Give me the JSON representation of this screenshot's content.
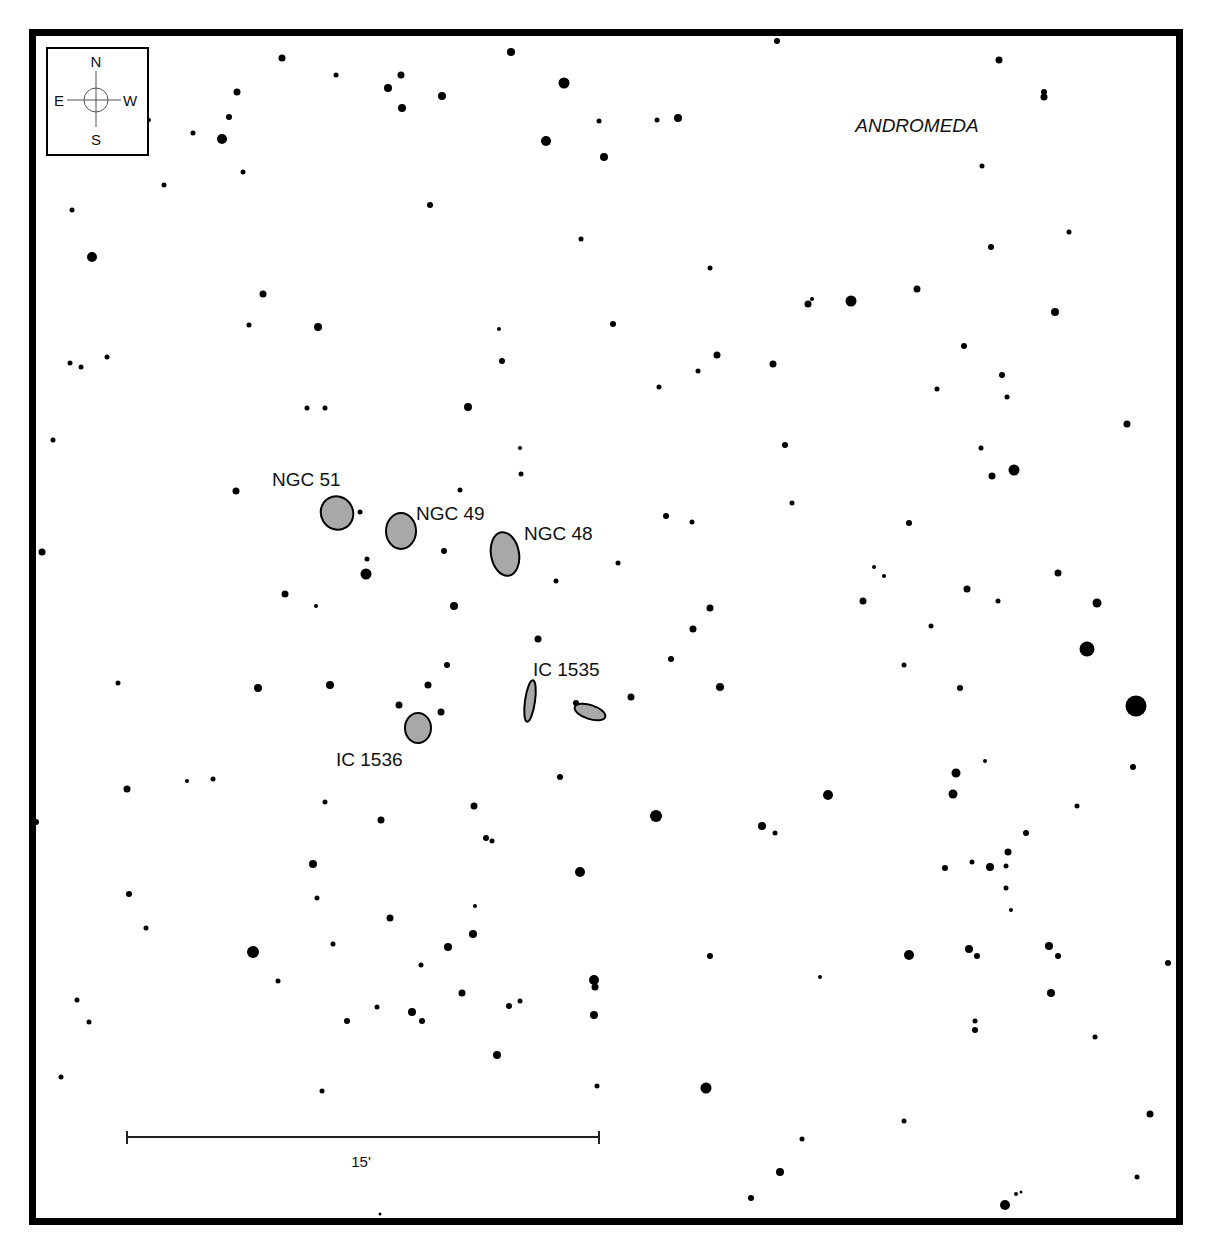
{
  "map": {
    "constellation": "ANDROMEDA",
    "compass": {
      "north": "N",
      "south": "S",
      "east": "E",
      "west": "W"
    },
    "scale_bar": {
      "label": "15'",
      "x1": 127,
      "x2": 599,
      "y": 1137
    },
    "colors": {
      "border": "#000000",
      "star": "#000000",
      "galaxy_fill": "#a8a8a8",
      "galaxy_stroke": "#000000",
      "background": "#ffffff"
    },
    "frame": {
      "x": 29,
      "y": 29,
      "width": 1154,
      "height": 1196,
      "stroke_width": 7
    },
    "galaxies": [
      {
        "name": "NGC 51",
        "cx": 337,
        "cy": 513,
        "rx": 16,
        "ry": 17,
        "rotate": -30,
        "label_x": 272,
        "label_y": 486
      },
      {
        "name": "NGC 49",
        "cx": 401,
        "cy": 531,
        "rx": 15,
        "ry": 18,
        "rotate": 0,
        "label_x": 416,
        "label_y": 520
      },
      {
        "name": "NGC 48",
        "cx": 505,
        "cy": 554,
        "rx": 14,
        "ry": 22,
        "rotate": -10,
        "label_x": 524,
        "label_y": 540
      },
      {
        "name": "IC 1535",
        "cx": 530,
        "cy": 701,
        "rx": 5,
        "ry": 21,
        "rotate": 8,
        "label_x": 533,
        "label_y": 676
      },
      {
        "name": "IC 1535b",
        "cx": 590,
        "cy": 712,
        "rx": 16,
        "ry": 7,
        "rotate": 18,
        "label_x": null,
        "label_y": null
      },
      {
        "name": "IC 1536",
        "cx": 418,
        "cy": 728,
        "rx": 13,
        "ry": 15,
        "rotate": 0,
        "label_x": 336,
        "label_y": 766
      }
    ],
    "stars": [
      [
        511,
        52,
        4
      ],
      [
        777,
        41,
        3
      ],
      [
        999,
        60,
        3.5
      ],
      [
        282,
        58,
        3.5
      ],
      [
        336,
        75,
        2.5
      ],
      [
        401,
        75,
        3.5
      ],
      [
        388,
        88,
        4
      ],
      [
        442,
        96,
        4
      ],
      [
        564,
        83,
        5.5
      ],
      [
        237,
        92,
        3.5
      ],
      [
        1044,
        92,
        3
      ],
      [
        1044,
        97,
        3.5
      ],
      [
        402,
        108,
        4
      ],
      [
        229,
        117,
        3
      ],
      [
        149,
        120,
        2
      ],
      [
        678,
        118,
        4
      ],
      [
        657,
        120,
        2.5
      ],
      [
        599,
        121,
        2.5
      ],
      [
        193,
        133,
        2.5
      ],
      [
        222,
        139,
        5
      ],
      [
        546,
        141,
        5
      ],
      [
        604,
        157,
        4
      ],
      [
        243,
        172,
        2.5
      ],
      [
        164,
        185,
        2.5
      ],
      [
        982,
        166,
        2.5
      ],
      [
        430,
        205,
        3
      ],
      [
        72,
        210,
        2.5
      ],
      [
        581,
        239,
        2.5
      ],
      [
        1069,
        232,
        2.5
      ],
      [
        991,
        247,
        3
      ],
      [
        92,
        257,
        5
      ],
      [
        710,
        268,
        2.5
      ],
      [
        263,
        294,
        3.5
      ],
      [
        917,
        289,
        3.5
      ],
      [
        851,
        301,
        5.5
      ],
      [
        808,
        304,
        3.5
      ],
      [
        812,
        299,
        2
      ],
      [
        1055,
        312,
        4
      ],
      [
        249,
        325,
        2.5
      ],
      [
        318,
        327,
        4
      ],
      [
        613,
        324,
        3
      ],
      [
        499,
        329,
        2
      ],
      [
        964,
        346,
        3
      ],
      [
        717,
        355,
        3.5
      ],
      [
        70,
        363,
        2.5
      ],
      [
        81,
        367,
        2.5
      ],
      [
        107,
        357,
        2.5
      ],
      [
        502,
        361,
        3
      ],
      [
        773,
        364,
        3.5
      ],
      [
        698,
        371,
        2.5
      ],
      [
        1002,
        375,
        3
      ],
      [
        659,
        387,
        2.5
      ],
      [
        937,
        389,
        2.5
      ],
      [
        1007,
        397,
        2.5
      ],
      [
        307,
        408,
        2.5
      ],
      [
        325,
        408,
        2.5
      ],
      [
        468,
        407,
        4
      ],
      [
        1127,
        424,
        3.5
      ],
      [
        53,
        440,
        2.5
      ],
      [
        785,
        445,
        3
      ],
      [
        520,
        448,
        2
      ],
      [
        981,
        448,
        2.5
      ],
      [
        1014,
        470,
        5.5
      ],
      [
        992,
        476,
        3.5
      ],
      [
        521,
        474,
        2.5
      ],
      [
        460,
        490,
        2.5
      ],
      [
        236,
        491,
        3.5
      ],
      [
        792,
        503,
        2.5
      ],
      [
        360,
        512,
        2.5
      ],
      [
        666,
        516,
        3
      ],
      [
        692,
        522,
        2.5
      ],
      [
        909,
        523,
        3
      ],
      [
        42,
        552,
        3.5
      ],
      [
        444,
        551,
        3
      ],
      [
        367,
        559,
        2.5
      ],
      [
        366,
        574,
        5.5
      ],
      [
        618,
        563,
        2.5
      ],
      [
        874,
        567,
        2
      ],
      [
        884,
        576,
        2
      ],
      [
        1058,
        573,
        3.5
      ],
      [
        556,
        581,
        2.5
      ],
      [
        967,
        589,
        3.5
      ],
      [
        285,
        594,
        3.5
      ],
      [
        863,
        601,
        3.5
      ],
      [
        998,
        601,
        2.5
      ],
      [
        1097,
        603,
        4.5
      ],
      [
        454,
        606,
        4
      ],
      [
        316,
        606,
        2
      ],
      [
        710,
        608,
        3.5
      ],
      [
        931,
        626,
        2.5
      ],
      [
        693,
        629,
        3.5
      ],
      [
        538,
        639,
        3.5
      ],
      [
        1087,
        649,
        7.5
      ],
      [
        447,
        665,
        3
      ],
      [
        904,
        665,
        2.5
      ],
      [
        671,
        659,
        3
      ],
      [
        118,
        683,
        2.5
      ],
      [
        258,
        688,
        4
      ],
      [
        330,
        685,
        4
      ],
      [
        428,
        685,
        3.5
      ],
      [
        720,
        687,
        4
      ],
      [
        960,
        688,
        3
      ],
      [
        631,
        697,
        3.5
      ],
      [
        399,
        705,
        3.5
      ],
      [
        441,
        712,
        3.5
      ],
      [
        576,
        703,
        3
      ],
      [
        1136,
        706,
        10.5
      ],
      [
        1133,
        767,
        3
      ],
      [
        985,
        761,
        2
      ],
      [
        956,
        773,
        4.5
      ],
      [
        560,
        777,
        3
      ],
      [
        187,
        781,
        2
      ],
      [
        213,
        779,
        2.5
      ],
      [
        127,
        789,
        3.5
      ],
      [
        828,
        795,
        5
      ],
      [
        953,
        794,
        4.5
      ],
      [
        325,
        802,
        2.5
      ],
      [
        474,
        806,
        3.5
      ],
      [
        1077,
        806,
        2.5
      ],
      [
        656,
        816,
        6
      ],
      [
        36,
        822,
        3
      ],
      [
        381,
        820,
        3.5
      ],
      [
        762,
        826,
        4
      ],
      [
        775,
        833,
        2.5
      ],
      [
        1026,
        833,
        3
      ],
      [
        486,
        838,
        3
      ],
      [
        492,
        841,
        2.5
      ],
      [
        1008,
        852,
        3.5
      ],
      [
        313,
        864,
        4
      ],
      [
        972,
        862,
        2.5
      ],
      [
        990,
        867,
        4
      ],
      [
        945,
        868,
        3
      ],
      [
        1006,
        866,
        2.5
      ],
      [
        580,
        872,
        5
      ],
      [
        1006,
        888,
        2.5
      ],
      [
        129,
        894,
        3
      ],
      [
        317,
        898,
        2.5
      ],
      [
        1011,
        910,
        2
      ],
      [
        475,
        906,
        2
      ],
      [
        390,
        918,
        3.5
      ],
      [
        146,
        928,
        2.5
      ],
      [
        473,
        934,
        4
      ],
      [
        333,
        944,
        2.5
      ],
      [
        448,
        947,
        4
      ],
      [
        1049,
        946,
        4
      ],
      [
        969,
        949,
        4
      ],
      [
        253,
        952,
        6
      ],
      [
        909,
        955,
        5
      ],
      [
        1058,
        956,
        3
      ],
      [
        977,
        956,
        3
      ],
      [
        710,
        956,
        3
      ],
      [
        1168,
        963,
        3
      ],
      [
        421,
        965,
        2.5
      ],
      [
        820,
        977,
        2
      ],
      [
        278,
        981,
        2.5
      ],
      [
        594,
        980,
        5
      ],
      [
        595,
        987,
        3.5
      ],
      [
        462,
        993,
        3.5
      ],
      [
        1051,
        993,
        4
      ],
      [
        77,
        1000,
        2.5
      ],
      [
        520,
        1001,
        2.5
      ],
      [
        509,
        1006,
        3
      ],
      [
        377,
        1007,
        2.5
      ],
      [
        412,
        1012,
        4
      ],
      [
        422,
        1021,
        3
      ],
      [
        594,
        1015,
        4
      ],
      [
        347,
        1021,
        3
      ],
      [
        975,
        1021,
        2.5
      ],
      [
        975,
        1030,
        3
      ],
      [
        89,
        1022,
        2.5
      ],
      [
        1095,
        1037,
        2.5
      ],
      [
        497,
        1055,
        4
      ],
      [
        61,
        1077,
        2.5
      ],
      [
        706,
        1088,
        5.5
      ],
      [
        322,
        1091,
        2.5
      ],
      [
        597,
        1086,
        2.5
      ],
      [
        1150,
        1114,
        3.5
      ],
      [
        904,
        1121,
        2.5
      ],
      [
        802,
        1139,
        2.5
      ],
      [
        780,
        1172,
        4
      ],
      [
        1137,
        1177,
        2.5
      ],
      [
        751,
        1198,
        3
      ],
      [
        1005,
        1205,
        5
      ],
      [
        1016,
        1194,
        2
      ],
      [
        1021,
        1192,
        1.5
      ],
      [
        380,
        1214,
        1.5
      ]
    ]
  }
}
